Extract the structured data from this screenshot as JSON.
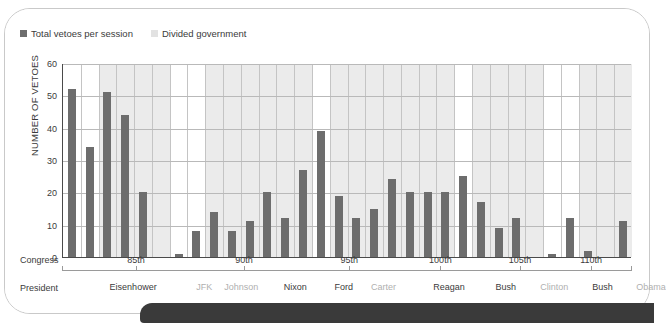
{
  "legend": {
    "items": [
      {
        "label": "Total vetoes per session",
        "swatch": "dark",
        "color": "#6d6d6d"
      },
      {
        "label": "Divided government",
        "swatch": "light",
        "color": "#e2e2e2"
      }
    ]
  },
  "axis": {
    "y_title": "NUMBER OF VETOES",
    "congress_row_label": "Congress",
    "president_row_label": "President"
  },
  "chart_data": {
    "type": "bar",
    "title": "",
    "xlabel": "Congress",
    "ylabel": "NUMBER OF VETOES",
    "ylim": [
      0,
      60
    ],
    "yticks": [
      0,
      10,
      20,
      30,
      40,
      50,
      60
    ],
    "grid": true,
    "legend_position": "top-left",
    "bar_color": "#6d6d6d",
    "divided_government_band_color": "#ebebeb",
    "series": [
      {
        "name": "Total vetoes per session",
        "categories": [
          "83rd",
          "84th",
          "85th",
          "86th",
          "87th",
          "88th",
          "89th",
          "90th",
          "91st",
          "92nd",
          "93rd",
          "94th",
          "95th",
          "96th",
          "97th",
          "98th",
          "99th",
          "100th",
          "101st",
          "102nd",
          "103rd",
          "104th",
          "105th",
          "106th",
          "107th",
          "108th",
          "109th",
          "110th",
          "111th",
          "112th"
        ],
        "values": [
          52,
          34,
          51,
          44,
          20,
          0,
          1,
          8,
          14,
          8,
          11,
          20,
          12,
          27,
          39,
          19,
          12,
          15,
          24,
          20,
          20,
          20,
          25,
          17,
          9,
          12,
          0,
          1,
          12,
          2,
          0,
          11
        ]
      }
    ],
    "divided_government_congresses": [
      "84th",
      "85th",
      "86th",
      "87th",
      "90th",
      "91st",
      "92nd",
      "93rd",
      "94th",
      "95th",
      "97th",
      "98th",
      "99th",
      "100th",
      "101st",
      "102nd",
      "104th",
      "105th",
      "106th",
      "107th",
      "110th",
      "111th",
      "112th"
    ],
    "annotations": []
  },
  "congress_ticks": [
    {
      "label": "85th",
      "x_pct": 13.0
    },
    {
      "label": "90th",
      "x_pct": 32.0
    },
    {
      "label": "95th",
      "x_pct": 50.5
    },
    {
      "label": "100th",
      "x_pct": 66.5
    },
    {
      "label": "105th",
      "x_pct": 80.5
    },
    {
      "label": "110th",
      "x_pct": 93.0
    }
  ],
  "presidents": [
    {
      "name": "Eisenhower",
      "x_pct": 12.5,
      "party": "rep"
    },
    {
      "name": "JFK",
      "x_pct": 25.0,
      "party": "dem"
    },
    {
      "name": "Johnson",
      "x_pct": 31.5,
      "party": "dem"
    },
    {
      "name": "Nixon",
      "x_pct": 41.0,
      "party": "rep"
    },
    {
      "name": "Ford",
      "x_pct": 49.5,
      "party": "rep"
    },
    {
      "name": "Carter",
      "x_pct": 56.5,
      "party": "dem"
    },
    {
      "name": "Reagan",
      "x_pct": 68.0,
      "party": "rep"
    },
    {
      "name": "Bush",
      "x_pct": 78.0,
      "party": "rep"
    },
    {
      "name": "Clinton",
      "x_pct": 86.5,
      "party": "dem"
    },
    {
      "name": "Bush",
      "x_pct": 95.0,
      "party": "rep"
    },
    {
      "name": "Obama",
      "x_pct": 103.5,
      "party": "dem"
    }
  ]
}
